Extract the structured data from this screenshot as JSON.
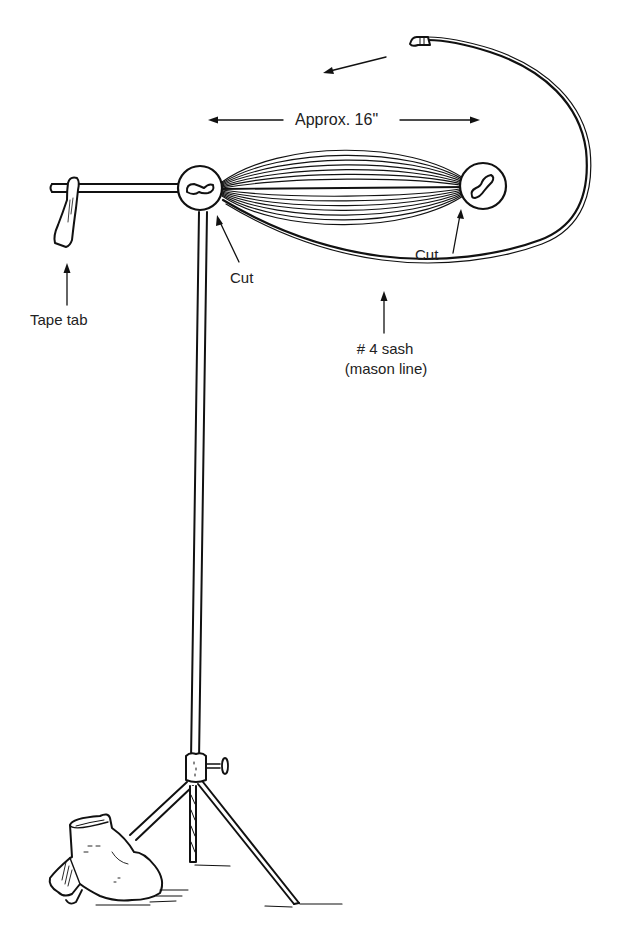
{
  "diagram": {
    "labels": {
      "length": "Approx. 16\"",
      "cut_left": "Cut",
      "cut_right": "Cut",
      "tape_tab": "Tape tab",
      "sash_line1": "# 4 sash",
      "sash_line2": "(mason line)"
    },
    "colors": {
      "ink": "#111111",
      "background": "#ffffff"
    },
    "components": [
      "horizontal-arm",
      "tape-tab",
      "left-hub",
      "right-hub",
      "wound-cord-bundle",
      "cord-loop",
      "vertical-pole",
      "clamp-collar",
      "tripod-legs",
      "sandbag"
    ]
  }
}
